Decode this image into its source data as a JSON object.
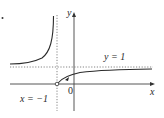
{
  "diagram": {
    "type": "function-graph",
    "axes": {
      "x_label": "x",
      "y_label": "y",
      "origin_label": "0"
    },
    "asymptotes": {
      "vertical": {
        "label": "x = −1",
        "value": -1
      },
      "horizontal": {
        "label": "y = 1",
        "value": 1
      }
    },
    "features": {
      "open_point": {
        "x": -1,
        "y": 0
      },
      "left_branch": "rises to +infinity near x = -1, approaches y = 1 as x -> -infinity from above",
      "right_branch": "starts at open circle (-1, 0), increases toward y = 1"
    },
    "colors": {
      "curve": "#2a2a2a",
      "axes": "#444444",
      "dashed": "#555555"
    }
  }
}
